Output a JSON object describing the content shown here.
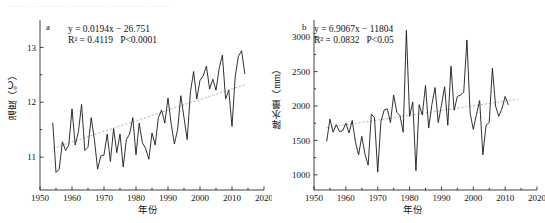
{
  "page": {
    "cut_off_text": "…………………………………………………"
  },
  "chart_data": [
    {
      "type": "line",
      "panel": "a",
      "title": "",
      "xlabel": "年份",
      "ylabel": "温度（℃）",
      "xlim": [
        1950,
        2020
      ],
      "ylim": [
        10.4,
        13.5
      ],
      "xticks": [
        1950,
        1960,
        1970,
        1980,
        1990,
        2000,
        2010,
        2020
      ],
      "yticks": [
        11,
        12,
        13
      ],
      "grid": false,
      "legend": "none",
      "annotations": {
        "equation": "y = 0.0194x − 26.751",
        "r_squared": "R² = 0.4119",
        "p_value": "P<0.0001",
        "slope": 0.0194,
        "intercept": -26.751,
        "r2": 0.4119
      },
      "trendline": {
        "x": [
          1954,
          2014
        ],
        "y": [
          11.16,
          12.32
        ]
      },
      "x": [
        1954,
        1955,
        1956,
        1957,
        1958,
        1959,
        1960,
        1961,
        1962,
        1963,
        1964,
        1965,
        1966,
        1967,
        1968,
        1969,
        1970,
        1971,
        1972,
        1973,
        1974,
        1975,
        1976,
        1977,
        1978,
        1979,
        1980,
        1981,
        1982,
        1983,
        1984,
        1985,
        1986,
        1987,
        1988,
        1989,
        1990,
        1991,
        1992,
        1993,
        1994,
        1995,
        1996,
        1997,
        1998,
        1999,
        2000,
        2001,
        2002,
        2003,
        2004,
        2005,
        2006,
        2007,
        2008,
        2009,
        2010,
        2011,
        2012,
        2013,
        2014
      ],
      "values": [
        11.62,
        10.72,
        10.78,
        11.28,
        11.12,
        11.22,
        11.88,
        11.22,
        11.46,
        11.96,
        11.12,
        11.18,
        11.72,
        11.32,
        10.78,
        11.02,
        11.04,
        11.42,
        10.92,
        11.52,
        11.08,
        11.42,
        10.82,
        11.32,
        11.42,
        11.72,
        11.04,
        11.62,
        11.26,
        11.16,
        10.96,
        11.44,
        11.22,
        11.72,
        11.86,
        11.62,
        12.08,
        11.6,
        11.24,
        11.5,
        12.12,
        11.72,
        11.32,
        12.18,
        12.56,
        12.06,
        12.4,
        12.48,
        12.66,
        12.24,
        12.42,
        12.22,
        12.62,
        12.86,
        12.06,
        12.22,
        11.56,
        12.46,
        12.84,
        12.94,
        12.52
      ]
    },
    {
      "type": "line",
      "panel": "b",
      "title": "",
      "xlabel": "年份",
      "ylabel": "降水量（mm）",
      "xlim": [
        1950,
        2020
      ],
      "ylim": [
        780,
        3250
      ],
      "xticks": [
        1950,
        1960,
        1970,
        1980,
        1990,
        2000,
        2010,
        2020
      ],
      "yticks": [
        1000,
        1500,
        2000,
        2500,
        3000
      ],
      "grid": false,
      "legend": "none",
      "annotations": {
        "equation": "y = 6.9067x − 11804",
        "r_squared": "R² = 0.0832",
        "p_value": "P<0.05",
        "slope": 6.9067,
        "intercept": -11804,
        "r2": 0.0832
      },
      "trendline": {
        "x": [
          1954,
          2014
        ],
        "y": [
          1685,
          2100
        ]
      },
      "x": [
        1954,
        1955,
        1956,
        1957,
        1958,
        1959,
        1960,
        1961,
        1962,
        1963,
        1964,
        1965,
        1966,
        1967,
        1968,
        1969,
        1970,
        1971,
        1972,
        1973,
        1974,
        1975,
        1976,
        1977,
        1978,
        1979,
        1980,
        1981,
        1982,
        1983,
        1984,
        1985,
        1986,
        1987,
        1988,
        1989,
        1990,
        1991,
        1992,
        1993,
        1994,
        1995,
        1996,
        1997,
        1998,
        1999,
        2000,
        2001,
        2002,
        2003,
        2004,
        2005,
        2006,
        2007,
        2008,
        2009,
        2010,
        2011,
        2012,
        2013,
        2014
      ],
      "values": [
        1490,
        1810,
        1620,
        1730,
        1630,
        1640,
        1750,
        1610,
        1790,
        1480,
        1290,
        1560,
        1300,
        1140,
        1880,
        1830,
        1040,
        1770,
        1940,
        1960,
        1760,
        2160,
        1910,
        1860,
        1620,
        3100,
        1850,
        2060,
        1060,
        2020,
        1870,
        2300,
        1680,
        2020,
        2270,
        1760,
        2010,
        2280,
        1720,
        2580,
        1940,
        2140,
        2160,
        2200,
        2960,
        1900,
        1660,
        1880,
        2080,
        1290,
        1720,
        1760,
        2550,
        2000,
        1850,
        1960,
        2140,
        2020
      ]
    }
  ]
}
